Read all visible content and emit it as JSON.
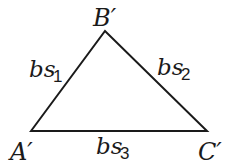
{
  "diagram": {
    "type": "triangle",
    "vertices": [
      {
        "id": "A",
        "label": "A′",
        "x": 31,
        "y": 131
      },
      {
        "id": "B",
        "label": "B′",
        "x": 105,
        "y": 31
      },
      {
        "id": "C",
        "label": "C′",
        "x": 207,
        "y": 131
      }
    ],
    "sides": [
      {
        "from": "A",
        "to": "B",
        "label_main": "bs",
        "label_sub": "1"
      },
      {
        "from": "B",
        "to": "C",
        "label_main": "bs",
        "label_sub": "2"
      },
      {
        "from": "A",
        "to": "C",
        "label_main": "bs",
        "label_sub": "3"
      }
    ],
    "stroke_color": "#1a1a1a"
  }
}
